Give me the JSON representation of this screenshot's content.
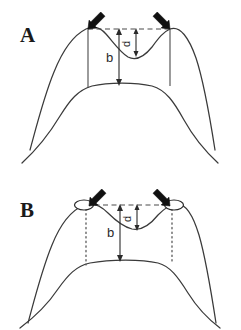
{
  "figure": {
    "background_color": "#ffffff",
    "stroke_color": "#3a3a3a",
    "marker_color": "#111111",
    "width": 241,
    "height": 330
  },
  "panels": [
    {
      "id": "A",
      "label": "A",
      "landmark_style": "arrow-only",
      "vertical_line_style": "solid",
      "measurements": [
        {
          "key": "b",
          "label": "b",
          "description": "vertical distance from landmark baseline to lower contour crest"
        },
        {
          "key": "d",
          "label": "d",
          "description": "depth of the central saddle below the landmark baseline"
        }
      ],
      "markers": [
        {
          "name": "left-landmark-arrow",
          "direction": "down-right"
        },
        {
          "name": "right-landmark-arrow",
          "direction": "down-left"
        }
      ]
    },
    {
      "id": "B",
      "label": "B",
      "landmark_style": "arrow-with-ellipse",
      "vertical_line_style": "dotted",
      "measurements": [
        {
          "key": "b",
          "label": "b",
          "description": "vertical distance from landmark baseline to lower contour crest"
        },
        {
          "key": "d",
          "label": "d",
          "description": "depth of the central saddle below the landmark baseline"
        }
      ],
      "markers": [
        {
          "name": "left-landmark-arrow",
          "direction": "down-right"
        },
        {
          "name": "right-landmark-arrow",
          "direction": "down-left"
        }
      ]
    }
  ]
}
